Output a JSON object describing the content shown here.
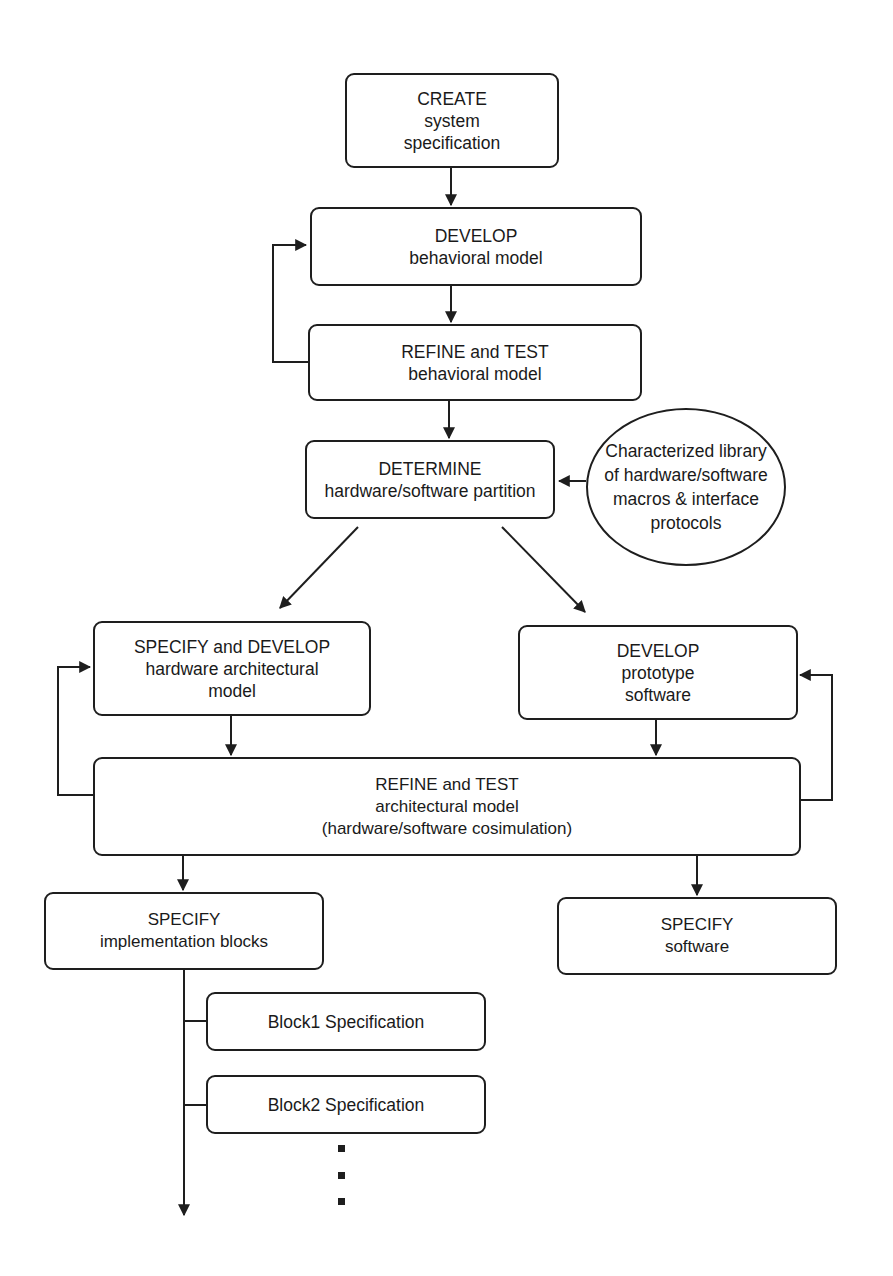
{
  "diagram": {
    "type": "flowchart",
    "nodes": [
      {
        "id": "create",
        "lines": [
          "CREATE",
          "system",
          "specification"
        ]
      },
      {
        "id": "develop_behavioral",
        "lines": [
          "DEVELOP",
          "behavioral model"
        ]
      },
      {
        "id": "refine_behavioral",
        "lines": [
          "REFINE and TEST",
          "behavioral model"
        ]
      },
      {
        "id": "determine_partition",
        "lines": [
          "DETERMINE",
          "hardware/software partition"
        ]
      },
      {
        "id": "library",
        "shape": "ellipse",
        "lines": [
          "Characterized library",
          "of hardware/software",
          "macros & interface",
          "protocols"
        ]
      },
      {
        "id": "specify_hw",
        "lines": [
          "SPECIFY and DEVELOP",
          "hardware architectural",
          "model"
        ]
      },
      {
        "id": "develop_sw",
        "lines": [
          "DEVELOP",
          "prototype",
          "software"
        ]
      },
      {
        "id": "refine_arch",
        "lines": [
          "REFINE and TEST",
          "architectural model",
          "(hardware/software cosimulation)"
        ]
      },
      {
        "id": "specify_blocks",
        "lines": [
          "SPECIFY",
          "implementation blocks"
        ]
      },
      {
        "id": "specify_sw",
        "lines": [
          "SPECIFY",
          "software"
        ]
      },
      {
        "id": "block1",
        "lines": [
          "Block1 Specification"
        ]
      },
      {
        "id": "block2",
        "lines": [
          "Block2 Specification"
        ]
      }
    ],
    "edges": [
      {
        "from": "create",
        "to": "develop_behavioral"
      },
      {
        "from": "develop_behavioral",
        "to": "refine_behavioral"
      },
      {
        "from": "refine_behavioral",
        "to": "develop_behavioral",
        "kind": "feedback"
      },
      {
        "from": "refine_behavioral",
        "to": "determine_partition"
      },
      {
        "from": "library",
        "to": "determine_partition"
      },
      {
        "from": "determine_partition",
        "to": "specify_hw"
      },
      {
        "from": "determine_partition",
        "to": "develop_sw"
      },
      {
        "from": "specify_hw",
        "to": "refine_arch"
      },
      {
        "from": "develop_sw",
        "to": "refine_arch"
      },
      {
        "from": "refine_arch",
        "to": "specify_hw",
        "kind": "feedback"
      },
      {
        "from": "refine_arch",
        "to": "develop_sw",
        "kind": "feedback"
      },
      {
        "from": "refine_arch",
        "to": "specify_blocks"
      },
      {
        "from": "refine_arch",
        "to": "specify_sw"
      },
      {
        "from": "specify_blocks",
        "to": "block1"
      },
      {
        "from": "specify_blocks",
        "to": "block2"
      }
    ],
    "continuation": "..."
  }
}
